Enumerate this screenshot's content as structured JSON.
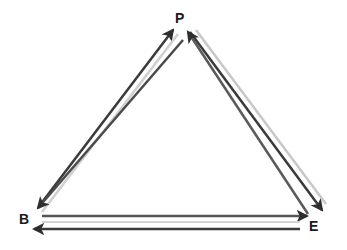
{
  "diagram": {
    "type": "triangle-cycle",
    "nodes": [
      {
        "id": "P",
        "label": "P",
        "x": 180,
        "y": 18
      },
      {
        "id": "B",
        "label": "B",
        "x": 25,
        "y": 219
      },
      {
        "id": "E",
        "label": "E",
        "x": 314,
        "y": 225
      }
    ],
    "edges": [
      {
        "from": "B",
        "to": "P",
        "direction": "bidirectional-pair"
      },
      {
        "from": "P",
        "to": "E",
        "direction": "bidirectional-pair"
      },
      {
        "from": "B",
        "to": "E",
        "direction": "bidirectional-pair"
      }
    ],
    "colors": {
      "arrow_dark": "#2e2e2e",
      "arrow_light": "#c8c8c8",
      "label": "#1a1a1a"
    }
  }
}
